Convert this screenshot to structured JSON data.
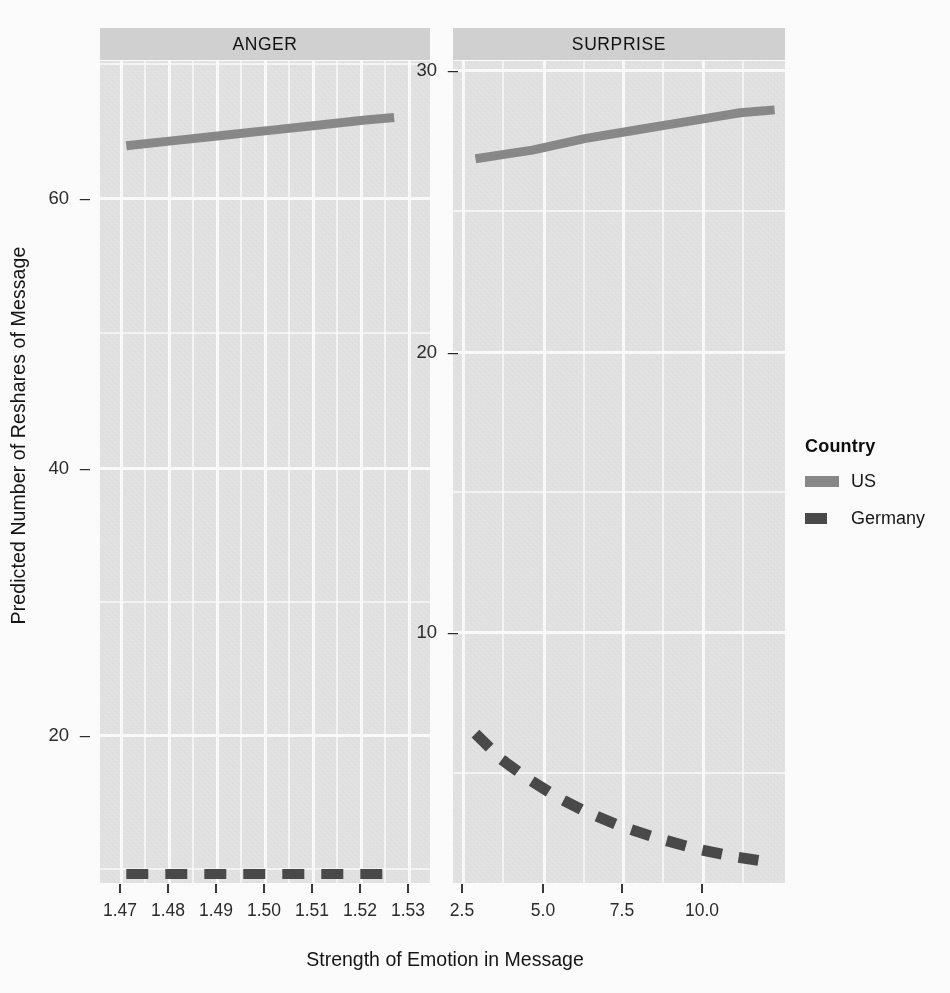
{
  "figure": {
    "x_axis_title": "Strength of Emotion in Message",
    "y_axis_title": "Predicted Number of Reshares of Message"
  },
  "panels": [
    {
      "id": "anger",
      "strip_label": "ANGER",
      "y_ticks": [
        "60",
        "40",
        "20"
      ],
      "x_ticks": [
        "1.47",
        "1.48",
        "1.49",
        "1.50",
        "1.51",
        "1.52",
        "1.53"
      ]
    },
    {
      "id": "surprise",
      "strip_label": "SURPRISE",
      "y_ticks": [
        "30",
        "20",
        "10"
      ],
      "x_ticks": [
        "2.5",
        "5.0",
        "7.5",
        "10.0"
      ]
    }
  ],
  "legend": {
    "title": "Country",
    "items": [
      {
        "label": "US",
        "style": "solid",
        "color": "#8a8a8a"
      },
      {
        "label": "Germany",
        "style": "dashed",
        "color": "#4a4a4a"
      }
    ]
  },
  "chart_data": {
    "type": "line",
    "title": "",
    "xlabel": "Strength of Emotion in Message",
    "ylabel": "Predicted Number of Reshares of Message",
    "facet_variable": "Emotion",
    "grid": true,
    "legend_position": "right",
    "legend_title": "Country",
    "facets": [
      {
        "name": "ANGER",
        "xlim": [
          1.465,
          1.534
        ],
        "ylim": [
          9.0,
          73.0
        ],
        "xticks": [
          1.47,
          1.48,
          1.49,
          1.5,
          1.51,
          1.52,
          1.53
        ],
        "yticks": [
          20,
          40,
          60
        ],
        "series": [
          {
            "name": "US",
            "style": "solid",
            "color": "#8a8a8a",
            "x": [
              1.4705,
              1.4805,
              1.4905,
              1.5005,
              1.5105,
              1.5205,
              1.5265
            ],
            "y": [
              66.4,
              66.8,
              67.2,
              67.6,
              68.0,
              68.4,
              68.6
            ]
          },
          {
            "name": "Germany",
            "style": "dashed",
            "color": "#4a4a4a",
            "x": [
              1.4705,
              1.4805,
              1.4905,
              1.5005,
              1.5105,
              1.5205,
              1.5265
            ],
            "y": [
              9.7,
              9.7,
              9.7,
              9.7,
              9.7,
              9.7,
              9.7
            ]
          }
        ]
      },
      {
        "name": "SURPRISE",
        "xlim": [
          2.2,
          11.8
        ],
        "ylim": [
          2.0,
          30.6
        ],
        "xticks": [
          2.5,
          5.0,
          7.5,
          10.0
        ],
        "yticks": [
          10,
          20,
          30
        ],
        "series": [
          {
            "name": "US",
            "style": "solid",
            "color": "#8a8a8a",
            "x": [
              2.85,
              4.5,
              6.0,
              7.5,
              9.0,
              10.5,
              11.5
            ],
            "y": [
              27.2,
              27.5,
              27.9,
              28.2,
              28.5,
              28.8,
              28.9
            ]
          },
          {
            "name": "Germany",
            "style": "dashed",
            "color": "#4a4a4a",
            "x": [
              2.85,
              3.6,
              4.4,
              5.2,
              6.0,
              7.0,
              8.0,
              9.2,
              10.4,
              11.5
            ],
            "y": [
              7.2,
              6.3,
              5.6,
              5.0,
              4.5,
              4.0,
              3.6,
              3.2,
              2.9,
              2.7
            ]
          }
        ]
      }
    ]
  }
}
